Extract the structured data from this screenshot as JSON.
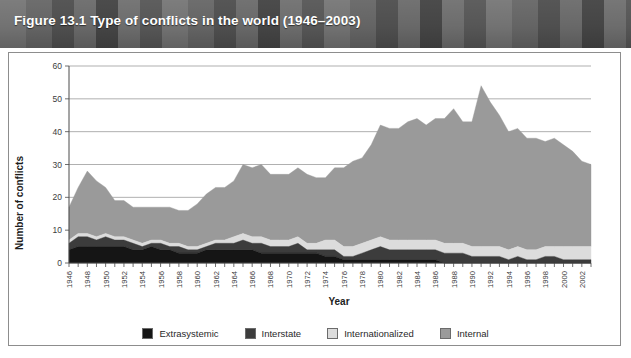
{
  "figure": {
    "title": "Figure 13.1 Type of conflicts in the world (1946–2003)",
    "banner_color": "#6f6f6f",
    "frame_border_color": "#8d8d8d"
  },
  "chart_data": {
    "type": "area",
    "stacked": true,
    "title": "Figure 13.1 Type of conflicts in the world (1946–2003)",
    "xlabel": "Year",
    "ylabel": "Number of conflicts",
    "ylim": [
      0,
      60
    ],
    "yticks": [
      0,
      10,
      20,
      30,
      40,
      50,
      60
    ],
    "xlim": [
      1946,
      2003
    ],
    "grid": true,
    "legend_position": "bottom",
    "x": [
      1946,
      1947,
      1948,
      1949,
      1950,
      1951,
      1952,
      1953,
      1954,
      1955,
      1956,
      1957,
      1958,
      1959,
      1960,
      1961,
      1962,
      1963,
      1964,
      1965,
      1966,
      1967,
      1968,
      1969,
      1970,
      1971,
      1972,
      1973,
      1974,
      1975,
      1976,
      1977,
      1978,
      1979,
      1980,
      1981,
      1982,
      1983,
      1984,
      1985,
      1986,
      1987,
      1988,
      1989,
      1990,
      1991,
      1992,
      1993,
      1994,
      1995,
      1996,
      1997,
      1998,
      1999,
      2000,
      2001,
      2002,
      2003
    ],
    "xtick_labels": [
      "1946",
      "1948",
      "1950",
      "1952",
      "1954",
      "1956",
      "1958",
      "1960",
      "1962",
      "1964",
      "1966",
      "1968",
      "1970",
      "1972",
      "1974",
      "1976",
      "1978",
      "1980",
      "1982",
      "1984",
      "1986",
      "1988",
      "1990",
      "1992",
      "1994",
      "1996",
      "1998",
      "2000",
      "2002"
    ],
    "xtick_step": 2,
    "series": [
      {
        "name": "Extrasystemic",
        "color": "#151515",
        "values": [
          4,
          5,
          5,
          5,
          5,
          5,
          5,
          4,
          4,
          5,
          4,
          4,
          3,
          3,
          3,
          4,
          4,
          4,
          4,
          4,
          4,
          3,
          3,
          3,
          3,
          3,
          3,
          3,
          2,
          2,
          1,
          1,
          1,
          1,
          1,
          1,
          1,
          1,
          1,
          1,
          1,
          0,
          0,
          0,
          0,
          0,
          0,
          0,
          0,
          0,
          0,
          0,
          0,
          0,
          0,
          0,
          0,
          0
        ]
      },
      {
        "name": "Interstate",
        "color": "#3c3c3c",
        "values": [
          2,
          3,
          3,
          2,
          3,
          2,
          2,
          2,
          1,
          1,
          2,
          1,
          2,
          1,
          1,
          1,
          2,
          2,
          2,
          3,
          2,
          3,
          2,
          2,
          2,
          3,
          1,
          1,
          2,
          2,
          1,
          1,
          2,
          3,
          4,
          3,
          3,
          3,
          3,
          3,
          3,
          3,
          3,
          3,
          2,
          2,
          2,
          2,
          1,
          2,
          1,
          1,
          2,
          2,
          1,
          1,
          1,
          1
        ]
      },
      {
        "name": "Internationalized",
        "color": "#dcdcdc",
        "values": [
          1,
          1,
          1,
          1,
          1,
          1,
          1,
          1,
          1,
          1,
          1,
          1,
          1,
          1,
          1,
          1,
          1,
          1,
          2,
          2,
          2,
          2,
          2,
          2,
          2,
          2,
          2,
          2,
          3,
          3,
          3,
          3,
          3,
          3,
          3,
          3,
          3,
          3,
          3,
          3,
          3,
          3,
          3,
          3,
          3,
          3,
          3,
          3,
          3,
          3,
          3,
          3,
          3,
          3,
          4,
          4,
          4,
          4
        ]
      },
      {
        "name": "Internal",
        "color": "#9a9a9a",
        "values": [
          10,
          14,
          19,
          17,
          14,
          11,
          11,
          10,
          11,
          10,
          10,
          11,
          10,
          11,
          13,
          15,
          16,
          16,
          17,
          21,
          21,
          22,
          20,
          20,
          20,
          21,
          21,
          20,
          19,
          22,
          24,
          26,
          26,
          29,
          34,
          34,
          34,
          36,
          37,
          35,
          37,
          38,
          41,
          37,
          38,
          49,
          44,
          40,
          36,
          36,
          34,
          34,
          32,
          33,
          31,
          29,
          26,
          25
        ]
      }
    ],
    "totals": [
      17,
      23,
      28,
      25,
      23,
      19,
      19,
      17,
      17,
      17,
      17,
      17,
      16,
      16,
      18,
      21,
      23,
      23,
      25,
      30,
      29,
      30,
      27,
      27,
      27,
      29,
      27,
      26,
      26,
      29,
      29,
      31,
      32,
      36,
      42,
      41,
      41,
      43,
      44,
      42,
      44,
      44,
      47,
      43,
      43,
      51,
      49,
      45,
      40,
      41,
      38,
      38,
      37,
      38,
      36,
      34,
      31,
      30
    ]
  },
  "legend": {
    "items": [
      {
        "label": "Extrasystemic",
        "color": "#151515"
      },
      {
        "label": "Interstate",
        "color": "#3c3c3c"
      },
      {
        "label": "Internationalized",
        "color": "#dcdcdc"
      },
      {
        "label": "Internal",
        "color": "#9a9a9a"
      }
    ]
  }
}
